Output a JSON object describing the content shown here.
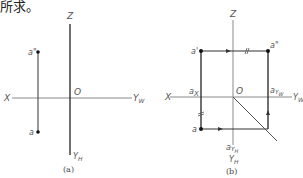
{
  "header_text": "所求。",
  "figure_a": {
    "caption": "(a)",
    "labels": {
      "z": "Z",
      "x": "X",
      "o": "O",
      "yw": "Y",
      "yw_sub": "W",
      "yh": "Y",
      "yh_sub": "H",
      "a_prime2": "a\"",
      "a": "a"
    }
  },
  "figure_b": {
    "caption": "(b)",
    "labels": {
      "z": "Z",
      "x": "X",
      "o": "O",
      "yw": "Y",
      "yw_sub": "W",
      "yh": "Y",
      "yh_sub": "H",
      "a_prime2": "a\"",
      "a_prime": "a'",
      "a": "a",
      "ax": "a",
      "ax_sub": "X",
      "ayw": "a",
      "ayw_sub": "Y",
      "ayw_sub2": "W",
      "ayh": "a",
      "ayh_sub": "Y",
      "ayh_sub2": "H"
    }
  },
  "colors": {
    "axis": "#8a8a8a",
    "line": "#333333",
    "point": "#111111"
  }
}
